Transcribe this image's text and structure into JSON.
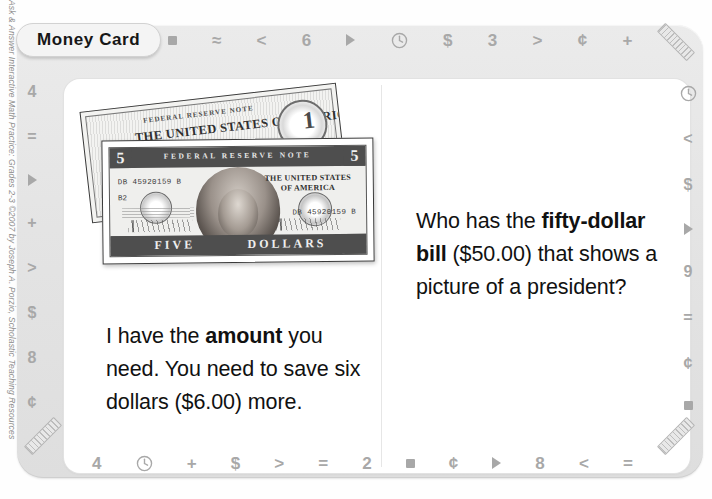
{
  "copyright": "Ask & Answer Interactive Math Practice: Grades 2-3 ©2007 by Joseph A. Porzio, Scholastic Teaching Resources",
  "tab": {
    "label": "Money Card"
  },
  "borders": {
    "top": [
      "square",
      "≈",
      "<",
      "6",
      "triangle",
      "clock",
      "$",
      "3",
      ">",
      "¢",
      "+"
    ],
    "bottom": [
      "4",
      "clock",
      "+",
      "$",
      ">",
      "=",
      "2",
      "square",
      "¢",
      "triangle",
      "8",
      "<",
      "="
    ],
    "left": [
      "4",
      "=",
      "triangle",
      "+",
      ">",
      "$",
      "8",
      "¢"
    ],
    "right": [
      "clock",
      "<",
      "$",
      "triangle",
      "9",
      "=",
      "¢",
      "square"
    ]
  },
  "panels": {
    "left": {
      "text_1": "I have the ",
      "bold_1": "amount",
      "text_2": " you need. You need to save six dollars ($6.00) more."
    },
    "right": {
      "text_1": "Who has the ",
      "bold_1": "fifty-dollar bill",
      "text_2": " ($50.00) that shows a picture of a president?"
    }
  },
  "bills": {
    "one_dollar": {
      "top_line": "FEDERAL RESERVE NOTE",
      "main_line": "THE UNITED STATES OF AMERICA",
      "denomination": "1"
    },
    "five_dollar": {
      "band_top": "FEDERAL      RESERVE      NOTE",
      "corner_value": "5",
      "serial_left": "DB 45920159 B",
      "plate_code": "B2",
      "serial_right": "DB 45920159 B",
      "country_label": "THE UNITED STATES OF AMERICA",
      "word_left": "FIVE",
      "word_right": "DOLLARS"
    }
  },
  "colors": {
    "frame": "#e6e6e6",
    "symbol": "#a8a8a8",
    "text": "#111111",
    "page": "#ffffff"
  }
}
